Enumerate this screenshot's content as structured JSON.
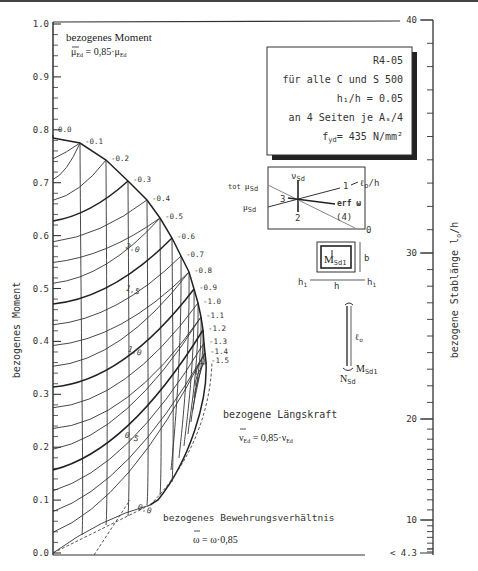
{
  "chart_data": {
    "type": "line",
    "id": "R4-05",
    "title_block": {
      "id": "R4-05",
      "line1": "für alle C und S 500",
      "line2": "h₁/h = 0.05",
      "line3": "an 4 Seiten je Aₛ/4",
      "line4": "f",
      "line4_sub": "yd",
      "line4_rest": "= 435 N/mm²"
    },
    "ylabel": "bezogenes Moment",
    "y_annotation": {
      "title": "bezogenes Moment",
      "formula": "μ̄Ed = 0,85·μEd",
      "formula_lhs": "μ",
      "formula_lhs_sub": "Ed",
      "formula_mid": " = 0,85·μ",
      "formula_rhs_sub": "Ed"
    },
    "ylim": [
      0.0,
      1.0
    ],
    "yticks": [
      "0.0",
      "0.1",
      "0.2",
      "0.3",
      "0.4",
      "0.5",
      "0.6",
      "0.7",
      "0.8",
      "0.9",
      "1.0"
    ],
    "right_axis": {
      "label": "bezogene Stablänge l₀/h",
      "label_main": "bezogene Stablänge  l",
      "label_sub": "o",
      "label_tail": "/h",
      "ticks": [
        "40",
        "30",
        "20",
        "10",
        "< 4.3"
      ]
    },
    "nu_annotation": {
      "title": "bezogene Längskraft",
      "formula_lhs": "ν",
      "formula_lhs_sub": "Ed",
      "formula_mid": " = 0,85·ν",
      "formula_rhs_sub": "Ed"
    },
    "omega_annotation": {
      "title": "bezogenes Bewehrungsverhältnis",
      "formula": "ω = ω·0,85"
    },
    "nu_series": [
      "0.0",
      "-0.1",
      "-0.2",
      "-0.3",
      "-0.4",
      "-0.5",
      "-0.6",
      "-0.7",
      "-0.8",
      "-0.9",
      "-1.0",
      "-1.1",
      "-1.2",
      "-1.3",
      "-1.4",
      "-1.5"
    ],
    "omega_series": [
      "0.0",
      "0.5",
      "1.0",
      "1.5",
      "2.0"
    ],
    "omega_curves_mu_at_left": [
      0.0,
      0.07,
      0.14,
      0.21,
      0.28,
      0.35,
      0.42,
      0.49,
      0.56,
      0.63,
      0.7
    ],
    "nu_curve_label_mu": [
      0.73,
      0.71,
      0.675,
      0.633,
      0.593,
      0.562,
      0.533,
      0.499,
      0.466,
      0.433,
      0.407,
      0.383,
      0.36,
      0.345,
      0.33,
      0.315
    ],
    "diagram": {
      "tot_mu": "tot μSd",
      "tot": "tot μ",
      "mu": "μ",
      "nu": "ν",
      "sd": "Sd",
      "erf": "erf  ω",
      "l0h": "ℓ₀/h",
      "l0h_main": "ℓ",
      "l0h_sub": "o",
      "l0h_tail": "/h",
      "labels": [
        "1",
        "2",
        "3",
        "(4)",
        "0"
      ]
    },
    "section": {
      "moment": "M",
      "moment_sub": "Sd1",
      "b": "b",
      "h": "h",
      "h1": "h",
      "h1_sub": "1"
    },
    "column": {
      "l0": "ℓ",
      "l0_sub": "o",
      "N": "N",
      "N_sub": "Sd",
      "M": "M",
      "M_sub": "Sd1"
    }
  }
}
